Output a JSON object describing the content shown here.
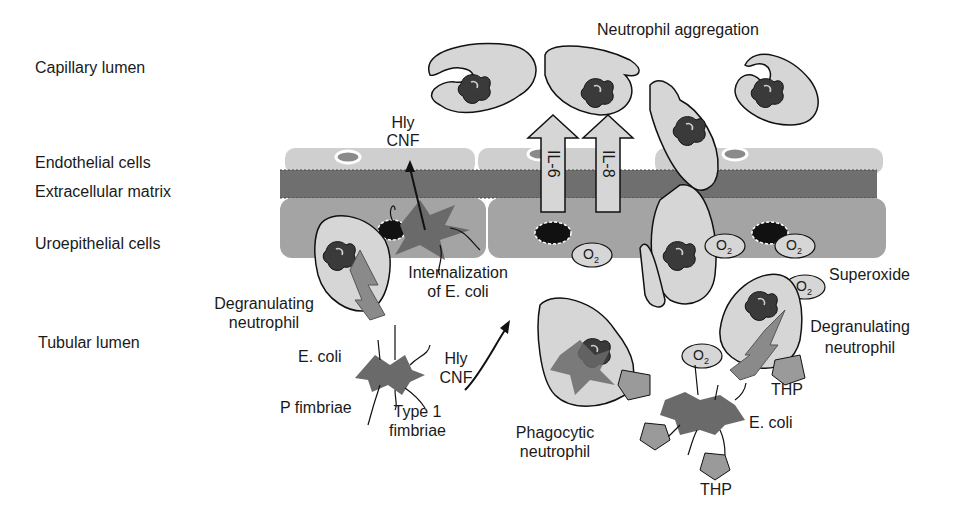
{
  "regions": {
    "capillary_lumen": "Capillary lumen",
    "endothelial_cells": "Endothelial cells",
    "extracellular_matrix": "Extracellular matrix",
    "uroepithelial_cells": "Uroepithelial cells",
    "tubular_lumen": "Tubular lumen"
  },
  "labels": {
    "neutrophil_aggregation": "Neutrophil aggregation",
    "hly_top_1": "Hly",
    "cnf_top_2": "CNF",
    "il6": "IL-6",
    "il8": "IL-8",
    "internalization_1": "Internalization",
    "internalization_2": "of E. coli",
    "degranulating_left_1": "Degranulating",
    "degranulating_left_2": "neutrophil",
    "ecoli_left": "E. coli",
    "hly_left_1": "Hly",
    "cnf_left_2": "CNF",
    "p_fimbriae": "P fimbriae",
    "type1_fimbriae_1": "Type 1",
    "type1_fimbriae_2": "fimbriae",
    "phagocytic_1": "Phagocytic",
    "phagocytic_2": "neutrophil",
    "superoxide": "Superoxide",
    "degranulating_right_1": "Degranulating",
    "degranulating_right_2": "neutrophil",
    "thp_right": "THP",
    "ecoli_right": "E. coli",
    "thp_bottom": "THP",
    "o2_symbol": "O",
    "o2_sub": "2",
    "o2_sup": "·−"
  },
  "colors": {
    "endothelium": "#cfcfcf",
    "ecm": "#6f6f6f",
    "uroepithelium": "#a4a4a4",
    "cell_fill": "#d6d6d6",
    "nucleus": "#3a3a3a",
    "bacterium": "#6a6a6a",
    "lightning": "#8a8a8a",
    "thp": "#9a9a9a",
    "outline": "#111111"
  }
}
